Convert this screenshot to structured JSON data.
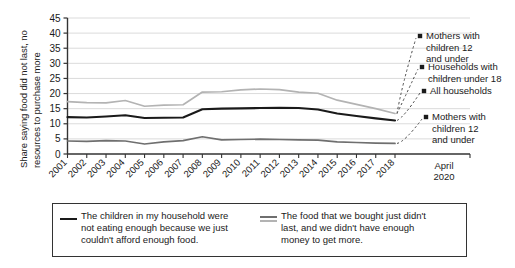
{
  "chart_data": {
    "type": "line",
    "title": "",
    "xlabel": "",
    "ylabel": "Share saying food did not last, no resources to purchase more",
    "ylabel_line1": "Share saying food did not last, no",
    "ylabel_line2": "resources to purchase more",
    "ylim": [
      0,
      45
    ],
    "ytick_step": 5,
    "yticks": [
      0,
      5,
      10,
      15,
      20,
      25,
      30,
      35,
      40,
      45
    ],
    "grid": true,
    "legend_position": "bottom",
    "categories": [
      "2001",
      "2002",
      "2003",
      "2004",
      "2005",
      "2006",
      "2007",
      "2008",
      "2009",
      "2010",
      "2011",
      "2012",
      "2013",
      "2014",
      "2015",
      "2016",
      "2017",
      "2018"
    ],
    "final_tick_label_line1": "April",
    "final_tick_label_line2": "2020",
    "series": [
      {
        "name": "Households with children under 18",
        "color": "#b3b3b3",
        "style": "solid-light",
        "values": [
          17.3,
          17.0,
          16.9,
          17.7,
          15.8,
          16.2,
          16.3,
          20.5,
          20.6,
          21.2,
          21.5,
          21.3,
          20.5,
          20.1,
          17.8,
          16.4,
          15.0,
          13.4
        ]
      },
      {
        "name": "All households",
        "color": "#1a1a1a",
        "style": "solid-dark",
        "values": [
          12.2,
          12.1,
          12.4,
          12.8,
          11.9,
          12.0,
          12.1,
          14.8,
          15.0,
          15.1,
          15.2,
          15.3,
          15.2,
          14.7,
          13.4,
          12.6,
          11.8,
          11.1
        ]
      },
      {
        "name": "Mothers with children 12 and under",
        "color": "#6f6f6f",
        "style": "solid-medium",
        "values": [
          4.3,
          4.2,
          4.4,
          4.3,
          3.3,
          4.0,
          4.4,
          5.7,
          4.7,
          4.8,
          4.9,
          4.8,
          4.7,
          4.6,
          4.0,
          3.8,
          3.6,
          3.5
        ]
      }
    ],
    "annotations": [
      {
        "id": "anno-1",
        "lines": [
          "Mothers with",
          "children 12",
          "and under"
        ]
      },
      {
        "id": "anno-2",
        "lines": [
          "Households with",
          "children under 18"
        ]
      },
      {
        "id": "anno-3",
        "lines": [
          "All households"
        ]
      },
      {
        "id": "anno-4",
        "lines": [
          "Mothers with",
          "children 12",
          "and under"
        ]
      }
    ],
    "legend": [
      {
        "id": "legend-entry-1",
        "marker": "solid-dark-line",
        "lines": [
          "The children in my household were",
          "not eating enough because we just",
          "couldn't afford enough food."
        ]
      },
      {
        "id": "legend-entry-2",
        "marker": "double-gray-line",
        "lines": [
          "The food that we bought just didn't",
          "last, and we didn't have enough",
          "money to get more."
        ]
      }
    ]
  }
}
